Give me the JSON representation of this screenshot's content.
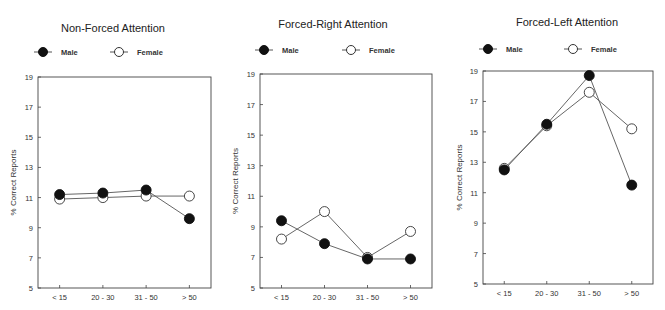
{
  "chart_data": [
    {
      "type": "line",
      "title": "Non-Forced Attention",
      "xlabel": "",
      "ylabel": "% Correct Reports",
      "categories": [
        "< 15",
        "20 - 30",
        "31 - 50",
        "> 50"
      ],
      "ylim": [
        5,
        19
      ],
      "yticks": [
        5,
        7,
        9,
        11,
        13,
        15,
        17,
        19
      ],
      "grid": false,
      "legend_position": "top",
      "series": [
        {
          "name": "Male",
          "marker": "filled-circle",
          "values": [
            11.2,
            11.3,
            11.5,
            9.6
          ]
        },
        {
          "name": "Female",
          "marker": "open-circle",
          "values": [
            10.9,
            11.0,
            11.1,
            11.1
          ]
        }
      ]
    },
    {
      "type": "line",
      "title": "Forced-Right Attention",
      "xlabel": "",
      "ylabel": "% Correct Reports",
      "categories": [
        "< 15",
        "20 - 30",
        "31 - 50",
        "> 50"
      ],
      "ylim": [
        5,
        19
      ],
      "yticks": [
        5,
        7,
        9,
        11,
        13,
        15,
        17,
        19
      ],
      "grid": false,
      "legend_position": "top",
      "series": [
        {
          "name": "Male",
          "marker": "filled-circle",
          "values": [
            9.4,
            7.9,
            6.9,
            6.9
          ]
        },
        {
          "name": "Female",
          "marker": "open-circle",
          "values": [
            8.2,
            10.0,
            7.0,
            8.7
          ]
        }
      ]
    },
    {
      "type": "line",
      "title": "Forced-Left Attention",
      "xlabel": "",
      "ylabel": "% Correct Reports",
      "categories": [
        "< 15",
        "20 - 30",
        "31 - 50",
        "> 50"
      ],
      "ylim": [
        5,
        19
      ],
      "yticks": [
        5,
        7,
        9,
        11,
        13,
        15,
        17,
        19
      ],
      "grid": false,
      "legend_position": "top",
      "series": [
        {
          "name": "Male",
          "marker": "filled-circle",
          "values": [
            12.5,
            15.5,
            18.7,
            11.5
          ]
        },
        {
          "name": "Female",
          "marker": "open-circle",
          "values": [
            12.6,
            15.4,
            17.6,
            15.2
          ]
        }
      ]
    }
  ],
  "panels": [
    {
      "title": "Non-Forced Attention",
      "legend_male": "Male",
      "legend_female": "Female",
      "ylabel": "% Correct Reports"
    },
    {
      "title": "Forced-Right Attention",
      "legend_male": "Male",
      "legend_female": "Female",
      "ylabel": "% Correct Reports"
    },
    {
      "title": "Forced-Left Attention",
      "legend_male": "Male",
      "legend_female": "Female",
      "ylabel": "% Correct Reports"
    }
  ],
  "colors": {
    "line": "#555555",
    "marker_fill_male": "#111111",
    "marker_fill_female": "#ffffff",
    "axis": "#444444"
  }
}
